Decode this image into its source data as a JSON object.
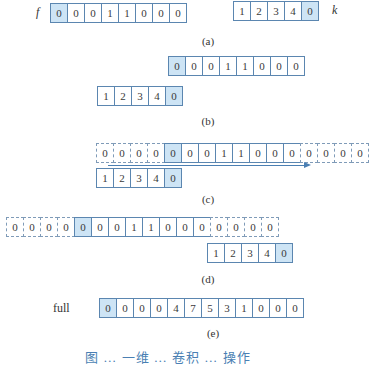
{
  "colors": {
    "highlight": "#cde4f5",
    "border": "#5b86b0",
    "arrow": "#4a7fb3"
  },
  "panel_a": {
    "f_label": "f",
    "f": [
      "0",
      "0",
      "0",
      "1",
      "1",
      "0",
      "0",
      "0"
    ],
    "k_label": "k",
    "k": [
      "1",
      "2",
      "3",
      "4",
      "0"
    ],
    "caption": "(a)"
  },
  "panel_b": {
    "f": [
      "0",
      "0",
      "0",
      "1",
      "1",
      "0",
      "0",
      "0"
    ],
    "k": [
      "1",
      "2",
      "3",
      "4",
      "0"
    ],
    "caption": "(b)"
  },
  "panel_c": {
    "padded_f": [
      "0",
      "0",
      "0",
      "0",
      "0",
      "0",
      "0",
      "1",
      "1",
      "0",
      "0",
      "0",
      "0",
      "0",
      "0",
      "0"
    ],
    "k": [
      "1",
      "2",
      "3",
      "4",
      "0"
    ],
    "arrow": "slide-right",
    "caption": "(c)"
  },
  "panel_d": {
    "padded_f": [
      "0",
      "0",
      "0",
      "0",
      "0",
      "0",
      "0",
      "1",
      "1",
      "0",
      "0",
      "0",
      "0",
      "0",
      "0",
      "0"
    ],
    "k": [
      "1",
      "2",
      "3",
      "4",
      "0"
    ],
    "caption": "(d)"
  },
  "panel_e": {
    "label": "full",
    "full": [
      "0",
      "0",
      "0",
      "0",
      "4",
      "7",
      "5",
      "3",
      "1",
      "0",
      "0",
      "0"
    ],
    "caption": "(e)"
  },
  "figure_caption": "图 … 一维 … 卷积 … 操作"
}
